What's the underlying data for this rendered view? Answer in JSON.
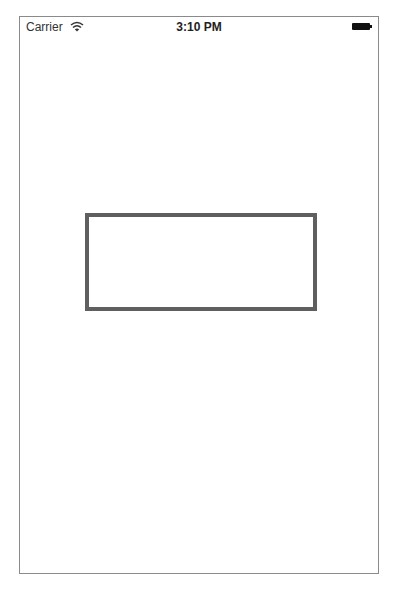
{
  "status_bar": {
    "carrier": "Carrier",
    "wifi_icon": "wifi-icon",
    "time": "3:10 PM",
    "battery_icon": "battery-icon"
  },
  "main": {
    "rectangle": {
      "border_color": "#5f5f5f",
      "fill_color": "#ffffff"
    }
  }
}
